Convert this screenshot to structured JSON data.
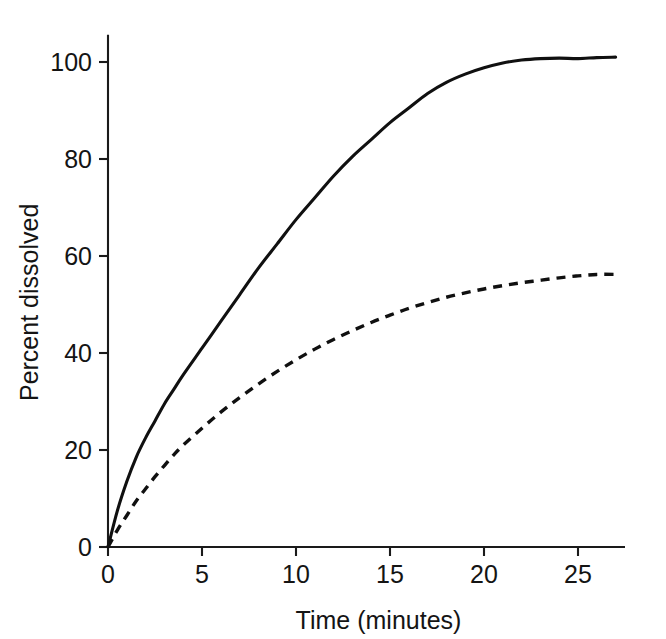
{
  "chart_data": {
    "type": "line",
    "title": "",
    "subtitle": "",
    "xlabel": "Time (minutes)",
    "ylabel": "Percent dissolved",
    "xlim": [
      0,
      27.5
    ],
    "ylim": [
      0,
      105
    ],
    "xticks": [
      0,
      5,
      10,
      15,
      20,
      25
    ],
    "xticklabels": [
      "0",
      "5",
      "10",
      "15",
      "20",
      "25"
    ],
    "yticks": [
      0,
      20,
      40,
      60,
      80,
      100
    ],
    "yticklabels": [
      "0",
      "20",
      "40",
      "60",
      "80",
      "100"
    ],
    "grid": false,
    "legend": null,
    "legend_position": "none",
    "annotations": [],
    "x": [
      0,
      0.5,
      1,
      1.5,
      2,
      2.5,
      3,
      3.5,
      4,
      5,
      6,
      7,
      8,
      9,
      10,
      11,
      12,
      13,
      14,
      15,
      16,
      17,
      18,
      19,
      20,
      21,
      22,
      23,
      24,
      25,
      26,
      27
    ],
    "series": [
      {
        "name": "solid-curve",
        "linestyle": "solid",
        "color": "#101010",
        "values": [
          0,
          7.5,
          13.5,
          18.5,
          22.5,
          26.0,
          29.5,
          32.5,
          35.5,
          41.0,
          46.5,
          52.0,
          57.5,
          62.5,
          67.5,
          72.0,
          76.5,
          80.5,
          84.0,
          87.5,
          90.5,
          93.5,
          95.8,
          97.5,
          98.8,
          99.8,
          100.4,
          100.7,
          100.8,
          100.7,
          100.9,
          101.0
        ]
      },
      {
        "name": "dashed-curve",
        "linestyle": "dashed",
        "color": "#101010",
        "values": [
          0,
          3.5,
          6.5,
          9.5,
          12.0,
          14.5,
          16.8,
          19.0,
          21.0,
          24.5,
          27.8,
          30.8,
          33.6,
          36.2,
          38.6,
          40.8,
          42.8,
          44.6,
          46.3,
          47.8,
          49.2,
          50.4,
          51.5,
          52.4,
          53.2,
          53.9,
          54.5,
          55.0,
          55.5,
          55.9,
          56.2,
          56.2
        ]
      }
    ]
  },
  "figure": {
    "background_color": "#ffffff",
    "axis_color": "#1a1a1a"
  }
}
